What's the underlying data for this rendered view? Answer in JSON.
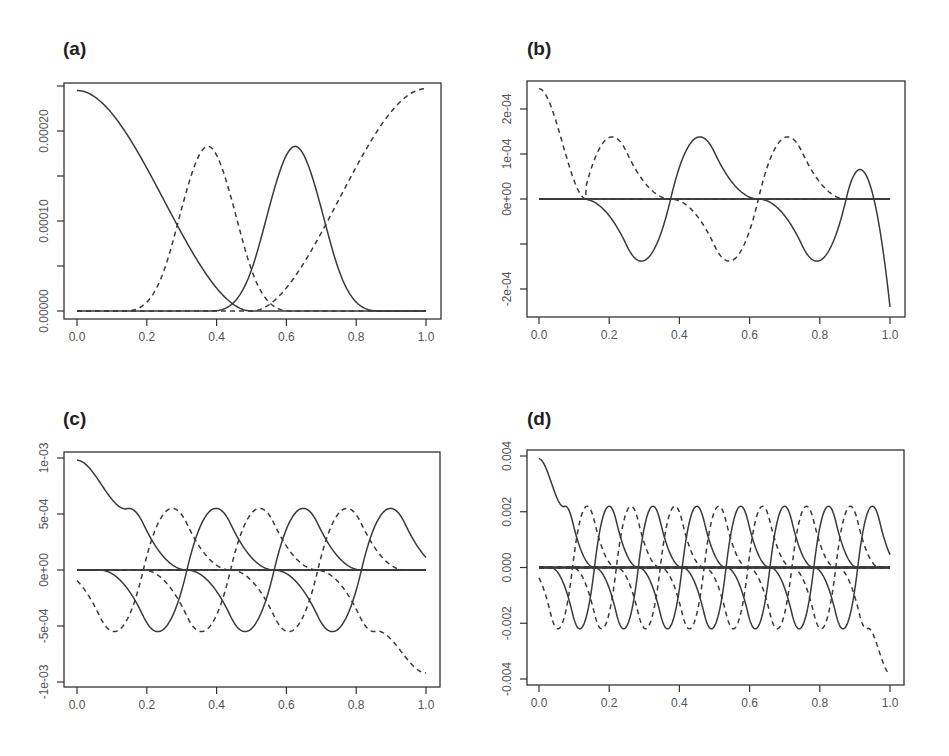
{
  "figure": {
    "panels": [
      {
        "id": "a",
        "label": "(a)"
      },
      {
        "id": "b",
        "label": "(b)"
      },
      {
        "id": "c",
        "label": "(c)"
      },
      {
        "id": "d",
        "label": "(d)"
      }
    ]
  },
  "chart_data": [
    {
      "panel": "(a)",
      "type": "line",
      "title": "(a)",
      "xlabel": "",
      "ylabel": "",
      "xlim": [
        0,
        1
      ],
      "ylim": [
        0,
        0.00025
      ],
      "x_ticks": [
        "0.0",
        "0.2",
        "0.4",
        "0.6",
        "0.8",
        "1.0"
      ],
      "y_ticks": [
        "0.00000",
        "0.00010",
        "0.00020"
      ],
      "y_minor_ticks": [
        0,
        5e-05,
        0.0001,
        0.00015,
        0.0002,
        0.00025
      ],
      "grid": false,
      "legend": null,
      "series": [
        {
          "name": "basis 1",
          "style": "solid",
          "shape": "decreasing bump",
          "x": [
            0,
            0.1,
            0.2,
            0.25,
            0.3,
            0.375,
            0.45,
            0.5,
            1.0
          ],
          "y": [
            0.000245,
            0.000225,
            0.00017,
            0.00012,
            8e-05,
            3e-05,
            8e-06,
            0,
            0
          ]
        },
        {
          "name": "basis 2",
          "style": "dashed",
          "shape": "bump",
          "x": [
            0,
            0.1,
            0.25,
            0.375,
            0.5,
            0.625,
            0.75,
            1.0
          ],
          "y": [
            0,
            3e-05,
            0.00012,
            0.000183,
            0.00012,
            3e-05,
            0,
            0
          ]
        },
        {
          "name": "basis 3",
          "style": "solid",
          "shape": "bump",
          "x": [
            0,
            0.25,
            0.375,
            0.5,
            0.625,
            0.75,
            0.9,
            1.0
          ],
          "y": [
            0,
            0,
            3e-05,
            0.00012,
            0.000183,
            0.00012,
            3e-05,
            0
          ]
        },
        {
          "name": "basis 4",
          "style": "dashed",
          "shape": "increasing bump",
          "x": [
            0,
            0.5,
            0.625,
            0.75,
            0.85,
            1.0
          ],
          "y": [
            0,
            0,
            3e-05,
            0.00012,
            0.0002,
            0.000247
          ]
        }
      ]
    },
    {
      "panel": "(b)",
      "type": "line",
      "title": "(b)",
      "xlim": [
        0,
        1
      ],
      "ylim": [
        -0.00025,
        0.00025
      ],
      "x_ticks": [
        "0.0",
        "0.2",
        "0.4",
        "0.6",
        "0.8",
        "1.0"
      ],
      "y_ticks": [
        "-2e-04",
        "0e+00",
        "1e-04",
        "2e-04"
      ],
      "y_minor_ticks": [
        -0.0002,
        -0.0001,
        0,
        0.0001,
        0.0002
      ],
      "grid": false,
      "legend": null,
      "series": [
        {
          "name": "dashed boundary",
          "style": "dashed",
          "x": [
            0,
            0.1,
            0.135,
            0.225,
            0.375,
            0.5
          ],
          "y": [
            0.000245,
            0.00016,
            0,
            -0.000133,
            -4e-05,
            0
          ]
        },
        {
          "name": "solid 1",
          "style": "solid",
          "x": [
            0,
            0.125,
            0.28,
            0.375,
            0.47,
            0.625,
            0.75,
            1.0
          ],
          "y": [
            0,
            3e-05,
            0.000138,
            0,
            -0.000133,
            -4e-05,
            0,
            0
          ]
        },
        {
          "name": "dashed 2",
          "style": "dashed",
          "x": [
            0,
            0.25,
            0.375,
            0.535,
            0.625,
            0.72,
            0.875,
            1.0
          ],
          "y": [
            0,
            0,
            4e-05,
            0.000138,
            0,
            -0.000133,
            -4e-05,
            0
          ]
        },
        {
          "name": "solid boundary",
          "style": "solid",
          "x": [
            0,
            0.5,
            0.625,
            0.78,
            0.87,
            1.0
          ],
          "y": [
            0,
            0,
            3e-05,
            0.000138,
            0,
            -0.00024
          ]
        }
      ]
    },
    {
      "panel": "(c)",
      "type": "line",
      "title": "(c)",
      "xlim": [
        0,
        1
      ],
      "ylim": [
        -0.001,
        0.001
      ],
      "x_ticks": [
        "0.0",
        "0.2",
        "0.4",
        "0.6",
        "0.8",
        "1.0"
      ],
      "y_ticks": [
        "-1e-03",
        "-5e-04",
        "0e+00",
        "5e-04",
        "1e-03"
      ],
      "grid": false,
      "legend": null,
      "notes": "Left boundary solid curve starts ~9.8e-04 at x=0; interior solid and dashed wavelets alternate with peaks ~5.5e-04 and troughs ~-5.5e-04; right boundary dashed curve drops to ~-9.2e-04 at x=1.",
      "series": [
        {
          "name": "solid peaks",
          "style": "solid",
          "x": [
            0.265,
            0.515,
            0.765
          ],
          "y": [
            0.00056,
            0.00056,
            0.00056
          ]
        },
        {
          "name": "solid troughs",
          "style": "solid",
          "x": [
            0.115,
            0.365,
            0.615,
            0.865
          ],
          "y": [
            -0.00053,
            -0.00053,
            -0.00053,
            -0.00053
          ]
        },
        {
          "name": "dashed peaks",
          "style": "dashed",
          "x": [
            0.14,
            0.39,
            0.64,
            0.89
          ],
          "y": [
            0.00056,
            0.00056,
            0.00056,
            0.00056
          ]
        },
        {
          "name": "dashed troughs",
          "style": "dashed",
          "x": [
            0.24,
            0.49,
            0.74
          ],
          "y": [
            -0.00053,
            -0.00053,
            -0.00053
          ]
        },
        {
          "name": "left boundary",
          "style": "solid",
          "x": [
            0,
            0.07,
            0.115
          ],
          "y": [
            0.00098,
            0,
            -0.00053
          ]
        },
        {
          "name": "right boundary",
          "style": "dashed",
          "x": [
            0.89,
            0.935,
            1.0
          ],
          "y": [
            0.00056,
            0,
            -0.00092
          ]
        }
      ]
    },
    {
      "panel": "(d)",
      "type": "line",
      "title": "(d)",
      "xlim": [
        0,
        1
      ],
      "ylim": [
        -0.004,
        0.004
      ],
      "x_ticks": [
        "0.0",
        "0.2",
        "0.4",
        "0.6",
        "0.8",
        "1.0"
      ],
      "y_ticks": [
        "-0.004",
        "-0.002",
        "0.000",
        "0.002",
        "0.004"
      ],
      "grid": false,
      "legend": null,
      "notes": "Left boundary solid curve starts ~0.0039 at x=0; interior solid and dashed wavelets alternate with peaks ~0.0022 and troughs ~-0.0022 (period ~0.125 each); right boundary dashed drops to ~-0.0038 at x=1.",
      "series": [
        {
          "name": "solid peaks",
          "style": "solid",
          "x": [
            0.135,
            0.26,
            0.385,
            0.51,
            0.635,
            0.76,
            0.885
          ],
          "y": [
            0.0022,
            0.0022,
            0.0022,
            0.0022,
            0.0022,
            0.0022,
            0.0022
          ]
        },
        {
          "name": "solid troughs",
          "style": "solid",
          "x": [
            0.06,
            0.185,
            0.31,
            0.435,
            0.56,
            0.685,
            0.81,
            0.935
          ],
          "y": [
            -0.0022,
            -0.0022,
            -0.0022,
            -0.0022,
            -0.0022,
            -0.0022,
            -0.0022,
            -0.0022
          ]
        },
        {
          "name": "dashed peaks",
          "style": "dashed",
          "x": [
            0.07,
            0.195,
            0.32,
            0.445,
            0.57,
            0.695,
            0.82,
            0.945
          ],
          "y": [
            0.0022,
            0.0022,
            0.0022,
            0.0022,
            0.0022,
            0.0022,
            0.0022,
            0.0022
          ]
        },
        {
          "name": "dashed troughs",
          "style": "dashed",
          "x": [
            0.12,
            0.245,
            0.37,
            0.495,
            0.62,
            0.745,
            0.87
          ],
          "y": [
            -0.0022,
            -0.0022,
            -0.0022,
            -0.0022,
            -0.0022,
            -0.0022,
            -0.0022
          ]
        },
        {
          "name": "left boundary",
          "style": "solid",
          "x": [
            0,
            0.035,
            0.06
          ],
          "y": [
            0.0039,
            0,
            -0.0022
          ]
        },
        {
          "name": "right boundary",
          "style": "dashed",
          "x": [
            0.945,
            0.975,
            1.0
          ],
          "y": [
            0.0022,
            0,
            -0.0038
          ]
        }
      ]
    }
  ]
}
